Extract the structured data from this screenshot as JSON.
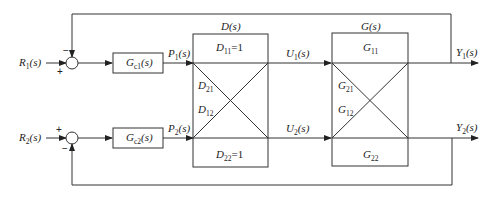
{
  "diagram": {
    "type": "multivariable decoupling control block diagram",
    "inputs": [
      {
        "name": "R",
        "sub": "1",
        "suffix": "(s)"
      },
      {
        "name": "R",
        "sub": "2",
        "suffix": "(s)"
      }
    ],
    "summing_junctions": [
      {
        "top_sign": "−",
        "left_sign": "+"
      },
      {
        "top_sign": "+",
        "bottom_sign": "−"
      }
    ],
    "controllers": [
      {
        "name": "G",
        "sub": "c1",
        "suffix": "(s)"
      },
      {
        "name": "G",
        "sub": "c2",
        "suffix": "(s)"
      }
    ],
    "controller_outputs": [
      {
        "name": "P",
        "sub": "1",
        "suffix": "(s)"
      },
      {
        "name": "P",
        "sub": "2",
        "suffix": "(s)"
      }
    ],
    "decoupler": {
      "title": "D(s)",
      "d11": {
        "name": "D",
        "sub": "11",
        "suffix": "=1"
      },
      "d21": {
        "name": "D",
        "sub": "21"
      },
      "d12": {
        "name": "D",
        "sub": "12"
      },
      "d22": {
        "name": "D",
        "sub": "22",
        "suffix": "=1"
      }
    },
    "decoupler_outputs": [
      {
        "name": "U",
        "sub": "1",
        "suffix": "(s)"
      },
      {
        "name": "U",
        "sub": "2",
        "suffix": "(s)"
      }
    ],
    "plant": {
      "title": "G(s)",
      "g11": {
        "name": "G",
        "sub": "11"
      },
      "g21": {
        "name": "G",
        "sub": "21"
      },
      "g12": {
        "name": "G",
        "sub": "12"
      },
      "g22": {
        "name": "G",
        "sub": "22"
      }
    },
    "outputs": [
      {
        "name": "Y",
        "sub": "1",
        "suffix": "(s)"
      },
      {
        "name": "Y",
        "sub": "2",
        "suffix": "(s)"
      }
    ]
  }
}
